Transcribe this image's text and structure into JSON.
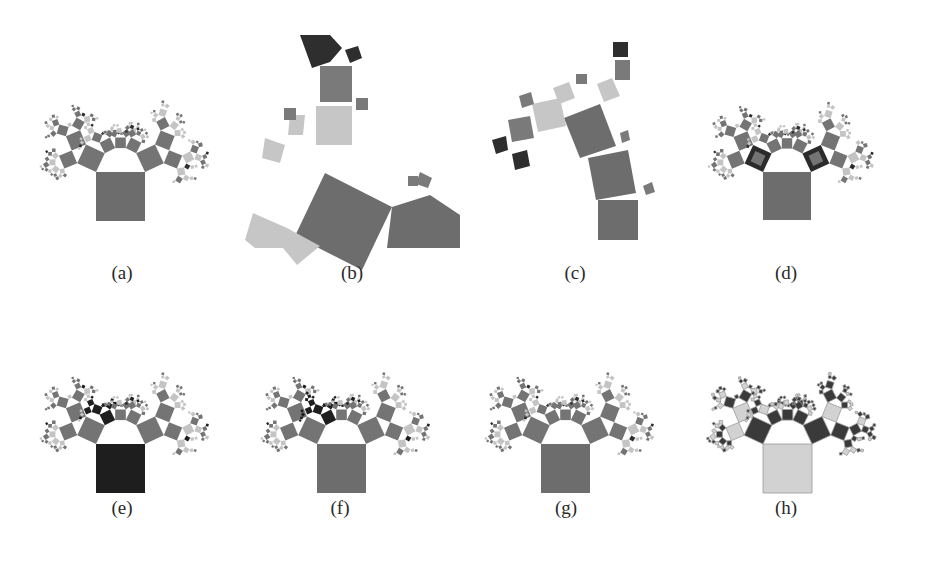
{
  "figure": {
    "panels": [
      {
        "id": "a",
        "caption": "(a)",
        "description": "Generalized Pythagoras tree, default coloring",
        "layout": {
          "left": 0,
          "top": 0,
          "caption_x": 122,
          "caption_y": 275
        },
        "tree": {
          "root_x": 96,
          "root_y": 172,
          "root_size": 49,
          "scheme": "mixed"
        },
        "colors": {
          "trunk": "#6d6d6d",
          "branch": "#747474",
          "light": "#c4c4c4",
          "dark": "#2e2e2e"
        }
      },
      {
        "id": "b",
        "caption": "(b)",
        "description": "Zoomed-in view of a subtree",
        "layout": {
          "left": 230,
          "top": 0,
          "caption_x": 352,
          "caption_y": 275
        },
        "tree": {
          "scheme": "zoom"
        },
        "colors": {
          "trunk": "#6d6d6d",
          "branch": "#7a7a7a",
          "light": "#c6c6c6",
          "dark": "#2e2e2e"
        }
      },
      {
        "id": "c",
        "caption": "(c)",
        "description": "Single path subtree",
        "layout": {
          "left": 460,
          "top": 0,
          "caption_x": 575,
          "caption_y": 275
        },
        "tree": {
          "scheme": "path"
        },
        "colors": {
          "trunk": "#6d6d6d",
          "branch": "#7a7a7a",
          "light": "#c6c6c6",
          "dark": "#2e2e2e"
        }
      },
      {
        "id": "d",
        "caption": "(d)",
        "description": "Tree with highlighted nodes (bordered)",
        "layout": {
          "left": 690,
          "top": 0,
          "caption_x": 785,
          "caption_y": 275
        },
        "tree": {
          "root_x": 763,
          "root_y": 172,
          "root_size": 48,
          "scheme": "highlight"
        },
        "colors": {
          "trunk": "#6d6d6d",
          "branch": "#747474",
          "light": "#c4c4c4",
          "dark": "#2b2b2b"
        }
      },
      {
        "id": "e",
        "caption": "(e)",
        "description": "Tree with dark-highlighted branch and root",
        "layout": {
          "left": 0,
          "top": 300,
          "caption_x": 122,
          "caption_y": 510
        },
        "tree": {
          "root_x": 96,
          "root_y": 444,
          "root_size": 49,
          "scheme": "dark-branch"
        },
        "colors": {
          "trunk": "#1e1e1e",
          "branch": "#747474",
          "light": "#c4c4c4",
          "dark": "#1e1e1e"
        }
      },
      {
        "id": "f",
        "caption": "(f)",
        "description": "Tree with dark-highlighted subtree",
        "layout": {
          "left": 230,
          "top": 300,
          "caption_x": 340,
          "caption_y": 510
        },
        "tree": {
          "root_x": 317,
          "root_y": 444,
          "root_size": 49,
          "scheme": "dark-subtree"
        },
        "colors": {
          "trunk": "#6d6d6d",
          "branch": "#747474",
          "light": "#c4c4c4",
          "dark": "#1e1e1e"
        }
      },
      {
        "id": "g",
        "caption": "(g)",
        "description": "Tree with default coloring variant",
        "layout": {
          "left": 460,
          "top": 300,
          "caption_x": 566,
          "caption_y": 510
        },
        "tree": {
          "root_x": 541,
          "root_y": 444,
          "root_size": 49,
          "scheme": "mixed"
        },
        "colors": {
          "trunk": "#6d6d6d",
          "branch": "#747474",
          "light": "#c4c4c4",
          "dark": "#2e2e2e"
        }
      },
      {
        "id": "h",
        "caption": "(h)",
        "description": "Tree with alternating light/dark coloring",
        "layout": {
          "left": 690,
          "top": 300,
          "caption_x": 785,
          "caption_y": 510
        },
        "tree": {
          "root_x": 763,
          "root_y": 444,
          "root_size": 49,
          "scheme": "alternate"
        },
        "colors": {
          "trunk": "#d2d2d2",
          "branch": "#3a3a3a",
          "light": "#d2d2d2",
          "dark": "#3a3a3a",
          "stroke": "#9a9a9a"
        }
      }
    ]
  }
}
